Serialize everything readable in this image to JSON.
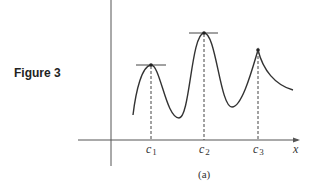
{
  "figure": {
    "caption": "Figure 3",
    "sublabel": "(a)",
    "axis": {
      "x_label": "x"
    },
    "points": [
      {
        "name": "c",
        "sub": "1",
        "kind": "local maximum (smooth peak, horizontal tangent)"
      },
      {
        "name": "c",
        "sub": "2",
        "kind": "absolute maximum (smooth peak, horizontal tangent)"
      },
      {
        "name": "c",
        "sub": "3",
        "kind": "local maximum (cusp, no tangent)"
      }
    ],
    "colors": {
      "curve": "#333333",
      "axes": "#555555",
      "background": "#ffffff"
    }
  }
}
